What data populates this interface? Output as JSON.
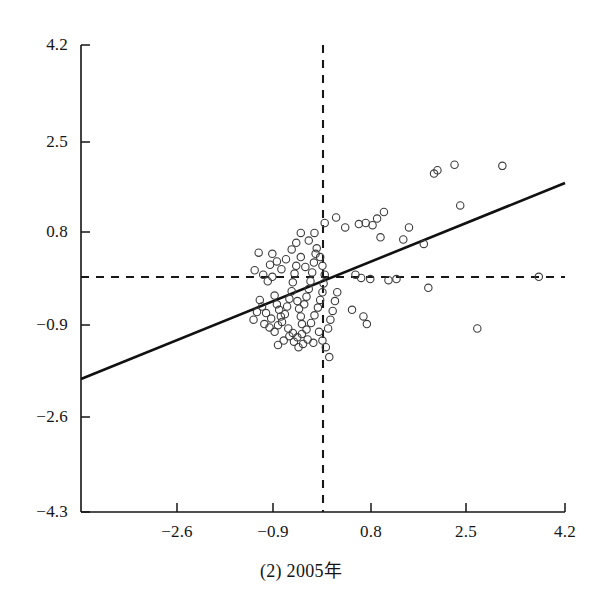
{
  "caption": "(2) 2005年",
  "chart_data": {
    "type": "scatter",
    "title": "",
    "xlabel": "",
    "ylabel": "",
    "xlim": [
      -4.3,
      4.2
    ],
    "ylim": [
      -4.3,
      4.2
    ],
    "grid": false,
    "legend": "none",
    "xticks": [
      -2.6,
      -0.9,
      0.8,
      2.5,
      4.2
    ],
    "xtick_labels": [
      "−2.6",
      "−0.9",
      "0.8",
      "2.5",
      "4.2"
    ],
    "yticks": [
      -4.3,
      -2.6,
      -0.9,
      0.8,
      2.5,
      4.2
    ],
    "ytick_labels": [
      "−4.3",
      "−2.6",
      "−0.9",
      "0.8",
      "2.5",
      "4.2"
    ],
    "marker": "open-circle",
    "marker_size": 5,
    "marker_color": "#3c3c3c",
    "reference_lines": [
      {
        "name": "vertical-mean-line",
        "orientation": "vertical",
        "value": -0.05,
        "style": "dashed",
        "color": "#1a1a1a"
      },
      {
        "name": "horizontal-mean-line",
        "orientation": "horizontal",
        "value": -0.05,
        "style": "dashed",
        "color": "#1a1a1a"
      }
    ],
    "fit_line": {
      "name": "regression-line",
      "style": "solid",
      "color": "#111111",
      "x_start": -4.3,
      "y_start": -2.05,
      "x_end": 4.2,
      "y_end": 1.53,
      "slope": 0.421,
      "intercept": -0.24
    },
    "points": [
      [
        -1.18,
        0.42
      ],
      [
        -1.25,
        0.1
      ],
      [
        -1.1,
        0.02
      ],
      [
        -1.02,
        -0.1
      ],
      [
        -0.98,
        0.2
      ],
      [
        -0.94,
        -0.02
      ],
      [
        -0.9,
        -0.36
      ],
      [
        -0.86,
        -0.52
      ],
      [
        -0.82,
        -0.62
      ],
      [
        -0.79,
        -0.74
      ],
      [
        -0.96,
        -0.78
      ],
      [
        -1.05,
        -0.68
      ],
      [
        -1.12,
        -0.56
      ],
      [
        -1.16,
        -0.44
      ],
      [
        -1.21,
        -0.66
      ],
      [
        -1.27,
        -0.8
      ],
      [
        -1.08,
        -0.88
      ],
      [
        -0.99,
        -0.94
      ],
      [
        -0.9,
        -1.02
      ],
      [
        -0.84,
        -0.9
      ],
      [
        -0.77,
        -0.84
      ],
      [
        -0.72,
        -0.7
      ],
      [
        -0.68,
        -0.56
      ],
      [
        -0.64,
        -0.42
      ],
      [
        -0.6,
        -0.28
      ],
      [
        -0.58,
        -0.12
      ],
      [
        -0.55,
        0.04
      ],
      [
        -0.52,
        0.18
      ],
      [
        -0.5,
        -0.46
      ],
      [
        -0.47,
        -0.6
      ],
      [
        -0.44,
        -0.74
      ],
      [
        -0.42,
        -0.88
      ],
      [
        -0.38,
        -0.52
      ],
      [
        -0.34,
        -0.38
      ],
      [
        -0.3,
        -0.24
      ],
      [
        -0.27,
        -0.1
      ],
      [
        -0.24,
        0.06
      ],
      [
        -0.21,
        0.24
      ],
      [
        -0.18,
        0.4
      ],
      [
        -0.6,
        0.48
      ],
      [
        -0.52,
        0.6
      ],
      [
        -0.44,
        0.34
      ],
      [
        -0.36,
        0.16
      ],
      [
        -0.7,
        0.3
      ],
      [
        -0.78,
        0.12
      ],
      [
        -0.86,
        0.26
      ],
      [
        -0.94,
        0.4
      ],
      [
        -0.66,
        -0.96
      ],
      [
        -0.58,
        -1.04
      ],
      [
        -0.5,
        -1.12
      ],
      [
        -0.42,
        -1.06
      ],
      [
        -0.34,
        -0.98
      ],
      [
        -0.26,
        -0.86
      ],
      [
        -0.2,
        -0.72
      ],
      [
        -0.14,
        -0.58
      ],
      [
        -0.1,
        -0.44
      ],
      [
        -0.06,
        -0.3
      ],
      [
        -0.04,
        -0.14
      ],
      [
        -0.02,
        0.02
      ],
      [
        -0.06,
        0.18
      ],
      [
        -0.1,
        0.34
      ],
      [
        -0.16,
        0.5
      ],
      [
        -0.3,
        0.64
      ],
      [
        -0.44,
        0.78
      ],
      [
        -0.12,
        -1.02
      ],
      [
        -0.06,
        -1.18
      ],
      [
        0.0,
        -1.3
      ],
      [
        0.04,
        -0.96
      ],
      [
        0.08,
        -0.8
      ],
      [
        0.12,
        -0.64
      ],
      [
        0.16,
        -0.46
      ],
      [
        0.2,
        -0.3
      ],
      [
        -0.22,
        -1.22
      ],
      [
        -0.32,
        -1.16
      ],
      [
        -0.4,
        -1.24
      ],
      [
        -0.48,
        -1.3
      ],
      [
        -0.56,
        -1.2
      ],
      [
        -0.64,
        -1.1
      ],
      [
        -0.74,
        -1.18
      ],
      [
        -0.84,
        -1.26
      ],
      [
        -0.2,
        0.78
      ],
      [
        0.18,
        1.06
      ],
      [
        0.46,
        -0.62
      ],
      [
        0.52,
        0.02
      ],
      [
        0.62,
        -0.04
      ],
      [
        0.66,
        -0.74
      ],
      [
        0.72,
        -0.88
      ],
      [
        0.78,
        -0.06
      ],
      [
        0.82,
        0.92
      ],
      [
        0.9,
        1.04
      ],
      [
        0.96,
        0.7
      ],
      [
        1.02,
        1.16
      ],
      [
        1.1,
        -0.08
      ],
      [
        1.24,
        -0.06
      ],
      [
        1.36,
        0.66
      ],
      [
        1.46,
        0.88
      ],
      [
        1.72,
        0.58
      ],
      [
        1.8,
        -0.22
      ],
      [
        1.9,
        1.86
      ],
      [
        1.96,
        1.92
      ],
      [
        2.26,
        2.02
      ],
      [
        2.36,
        1.28
      ],
      [
        2.66,
        -0.96
      ],
      [
        3.1,
        2.0
      ],
      [
        3.74,
        -0.02
      ],
      [
        0.34,
        0.88
      ],
      [
        0.58,
        0.94
      ],
      [
        0.7,
        0.96
      ],
      [
        -0.02,
        0.96
      ],
      [
        0.06,
        -1.48
      ]
    ]
  }
}
